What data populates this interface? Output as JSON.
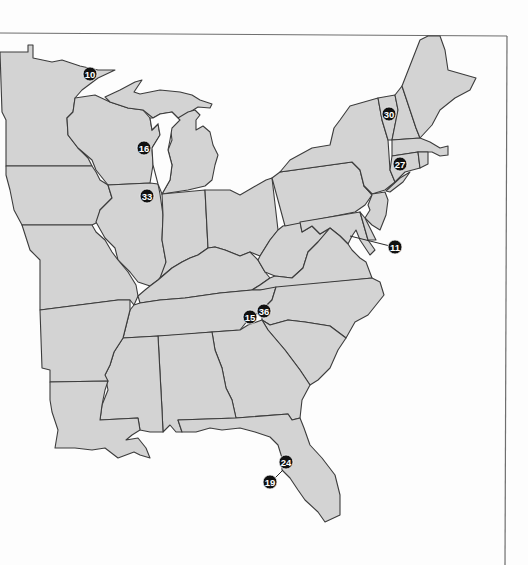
{
  "map": {
    "region": "Eastern United States",
    "colors": {
      "land": "#d3d3d3",
      "border": "#3c3c3c",
      "water": "#fdfdfd",
      "marker": "#111111",
      "marker_text": "#ffffff",
      "frame": "#6e6e6e"
    },
    "markers": [
      {
        "label": "10",
        "x": 90,
        "y": 74
      },
      {
        "label": "16",
        "x": 144,
        "y": 148
      },
      {
        "label": "33",
        "x": 147,
        "y": 196
      },
      {
        "label": "30",
        "x": 389,
        "y": 114
      },
      {
        "label": "27",
        "x": 400,
        "y": 164
      },
      {
        "label": "11",
        "x": 395,
        "y": 247
      },
      {
        "label": "15",
        "x": 250,
        "y": 317
      },
      {
        "label": "36",
        "x": 264,
        "y": 311
      },
      {
        "label": "24",
        "x": 286,
        "y": 462
      },
      {
        "label": "19",
        "x": 270,
        "y": 482
      }
    ]
  }
}
